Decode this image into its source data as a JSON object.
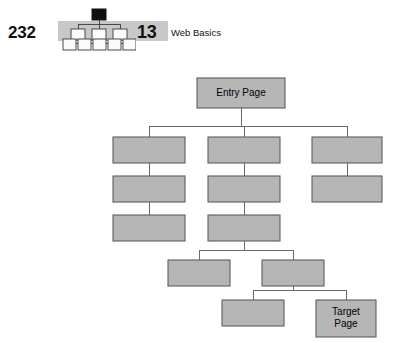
{
  "header": {
    "folio": "232",
    "chapter_number": "13",
    "chapter_title": "Web Basics",
    "icon_name": "site-tree-icon",
    "band_color": "#c8c8c8"
  },
  "figure": {
    "box_fill": "#b6b6b6",
    "box_stroke": "#5d5d5d",
    "connector_color": "#6a6a6a",
    "entry_label": "Entry Page",
    "target_label": "Target\nPage",
    "nodes": [
      {
        "id": "entry",
        "label": "Entry Page",
        "x": 197,
        "y": 16,
        "w": 88,
        "h": 30,
        "lines": [
          "Entry Page"
        ]
      },
      {
        "id": "l1c1",
        "label": "",
        "x": 113,
        "y": 75,
        "w": 72,
        "h": 26,
        "lines": []
      },
      {
        "id": "l1c2",
        "label": "",
        "x": 208,
        "y": 75,
        "w": 72,
        "h": 26,
        "lines": []
      },
      {
        "id": "l1c3",
        "label": "",
        "x": 312,
        "y": 75,
        "w": 70,
        "h": 26,
        "lines": []
      },
      {
        "id": "l2c1",
        "label": "",
        "x": 113,
        "y": 114,
        "w": 72,
        "h": 26,
        "lines": []
      },
      {
        "id": "l2c2",
        "label": "",
        "x": 208,
        "y": 114,
        "w": 72,
        "h": 26,
        "lines": []
      },
      {
        "id": "l2c3",
        "label": "",
        "x": 312,
        "y": 114,
        "w": 70,
        "h": 26,
        "lines": []
      },
      {
        "id": "l3c1",
        "label": "",
        "x": 113,
        "y": 153,
        "w": 72,
        "h": 26,
        "lines": []
      },
      {
        "id": "l3c2",
        "label": "",
        "x": 208,
        "y": 153,
        "w": 72,
        "h": 26,
        "lines": []
      },
      {
        "id": "l4a",
        "label": "",
        "x": 168,
        "y": 198,
        "w": 62,
        "h": 26,
        "lines": []
      },
      {
        "id": "l4b",
        "label": "",
        "x": 262,
        "y": 198,
        "w": 62,
        "h": 26,
        "lines": []
      },
      {
        "id": "l5a",
        "label": "",
        "x": 222,
        "y": 238,
        "w": 62,
        "h": 26,
        "lines": []
      },
      {
        "id": "target",
        "label": "Target Page",
        "x": 316,
        "y": 238,
        "w": 60,
        "h": 37,
        "lines": [
          "Target",
          "Page"
        ]
      }
    ],
    "edges": [
      {
        "from": "entry",
        "to": [
          "l1c1",
          "l1c2",
          "l1c3"
        ],
        "bus_y": 64
      },
      {
        "from": "l1c1",
        "to": [
          "l2c1"
        ]
      },
      {
        "from": "l2c1",
        "to": [
          "l3c1"
        ]
      },
      {
        "from": "l1c2",
        "to": [
          "l2c2"
        ]
      },
      {
        "from": "l2c2",
        "to": [
          "l3c2"
        ]
      },
      {
        "from": "l1c3",
        "to": [
          "l2c3"
        ]
      },
      {
        "from": "l3c2",
        "to": [
          "l4a",
          "l4b"
        ],
        "bus_y": 188
      },
      {
        "from": "l4b",
        "to": [
          "l5a",
          "target"
        ],
        "bus_y": 228
      }
    ]
  }
}
